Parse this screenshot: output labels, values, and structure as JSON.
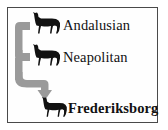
{
  "figure": {
    "border_color": "#4a4a4a",
    "background_color": "#ffffff"
  },
  "arrow": {
    "color": "#9a9a9a",
    "description": "gray branching arrow from two parent breeds down to the descendant breed"
  },
  "nodes": [
    {
      "id": "andalusian",
      "label": "Andalusian",
      "role": "parent-breed",
      "icon": "horse-icon",
      "icon_color": "#111111",
      "bold": false
    },
    {
      "id": "neapolitan",
      "label": "Neapolitan",
      "role": "parent-breed",
      "icon": "horse-icon",
      "icon_color": "#111111",
      "bold": false
    },
    {
      "id": "frederiksborg",
      "label": "Frederiksborg",
      "role": "descendant-breed",
      "icon": "horse-icon",
      "icon_color": "#111111",
      "bold": true
    }
  ]
}
